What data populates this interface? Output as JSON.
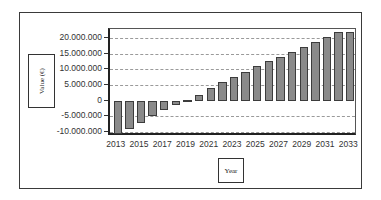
{
  "chart_data": {
    "type": "bar",
    "title": "",
    "xlabel": "Year",
    "ylabel": "Value (€)",
    "categories": [
      "2013",
      "2014",
      "2015",
      "2016",
      "2017",
      "2018",
      "2019",
      "2020",
      "2021",
      "2022",
      "2023",
      "2024",
      "2025",
      "2026",
      "2027",
      "2028",
      "2029",
      "2030",
      "2031",
      "2032",
      "2033"
    ],
    "values": [
      -10600000,
      -9000000,
      -7000000,
      -5000000,
      -3000000,
      -1500000,
      300000,
      2000000,
      4000000,
      6000000,
      7700000,
      9200000,
      11000000,
      12700000,
      14000000,
      15600000,
      17200000,
      18700000,
      20300000,
      22000000,
      22000000
    ],
    "ylim": [
      -10600000,
      22600000
    ],
    "yticks": [
      -10000000,
      -5000000,
      0,
      5000000,
      10000000,
      15000000,
      20000000
    ],
    "ytick_labels": [
      "-10.000.000",
      "-5.000.000",
      "0",
      "5.000.000",
      "10.000.000",
      "15.000.000",
      "20.000.000"
    ],
    "xtick_labels": [
      "2013",
      "2015",
      "2017",
      "2019",
      "2021",
      "2023",
      "2025",
      "2027",
      "2029",
      "2031",
      "2033"
    ],
    "grid": true,
    "legend": null,
    "colors": {
      "bar_fill": "#8a8a8a",
      "bar_border": "#3c3c3c",
      "grid": "#9a9a9a"
    }
  },
  "axes": {
    "x_title": "Year",
    "y_title": "Value (€)"
  }
}
